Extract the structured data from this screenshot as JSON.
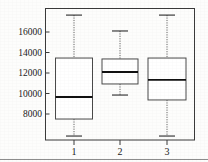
{
  "chart_data": {
    "type": "box",
    "title": "",
    "xlabel": "",
    "ylabel": "",
    "categories": [
      "1",
      "2",
      "3"
    ],
    "ylim": [
      5200,
      18300
    ],
    "grid": false,
    "legend": "none",
    "y_ticks": [
      8000,
      10000,
      12000,
      14000,
      16000
    ],
    "y_tick_labels": [
      "8000",
      "10000",
      "12000",
      "14000",
      "16000"
    ],
    "x_ticks": [
      "1",
      "2",
      "3"
    ],
    "boxes": [
      {
        "category": "1",
        "whisker_low": 5850,
        "q1": 7510,
        "median": 9660,
        "q3": 13460,
        "whisker_high": 17650
      },
      {
        "category": "2",
        "whisker_low": 9850,
        "q1": 10930,
        "median": 12100,
        "q3": 13370,
        "whisker_high": 16100
      },
      {
        "category": "3",
        "whisker_low": 5850,
        "q1": 9370,
        "median": 11320,
        "q3": 13460,
        "whisker_high": 17650
      }
    ],
    "colors": {
      "box_fill": "#ffffff",
      "box_stroke": "#4a4a4a",
      "median": "#111111",
      "whisker": "#555555",
      "frame": "#3a3a3a",
      "text": "#1a1a1a"
    }
  }
}
